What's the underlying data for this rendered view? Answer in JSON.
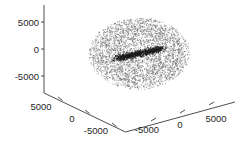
{
  "figure": {
    "width": 241,
    "height": 150,
    "background": "#ffffff"
  },
  "chart_data": {
    "type": "scatter",
    "title": "",
    "xlabel": "",
    "ylabel": "",
    "zlabel": "",
    "projection": "3d",
    "grid": false,
    "legend": null,
    "axis_color": "#3a3a3a",
    "marker_color": "#6e6e6e",
    "core_marker_color": "#1c1c1c",
    "axes": {
      "z": {
        "name": "z-axis",
        "ticks": [
          5000,
          0,
          -5000
        ],
        "tick_labels": [
          "5000",
          "0",
          "-5000"
        ],
        "range": [
          -7500,
          7500
        ]
      },
      "x": {
        "name": "x-axis",
        "ticks": [
          5000,
          0,
          -5000
        ],
        "tick_labels": [
          "5000",
          "0",
          "-5000"
        ],
        "range": [
          -7500,
          7500
        ]
      },
      "y": {
        "name": "y-axis",
        "ticks": [
          -5000,
          0,
          5000
        ],
        "tick_labels": [
          "-5000",
          "0",
          "5000"
        ],
        "range": [
          -7500,
          7500
        ]
      }
    },
    "n_points": 4200,
    "n_core_points": 160,
    "cloud_radius": 5600,
    "core_extent": 2600
  }
}
